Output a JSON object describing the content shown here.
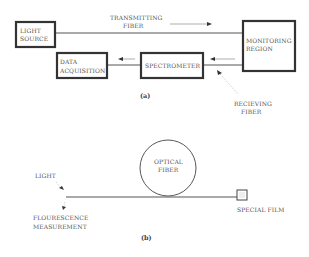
{
  "figure_a": {
    "caption": "(a)",
    "boxes": {
      "light_source": [
        "LIGHT",
        "SOURCE"
      ],
      "monitoring_region": [
        "MONITORING",
        "REGION"
      ],
      "spectrometer": [
        "SPECTROMETER"
      ],
      "data_acquisition": [
        "DATA",
        "ACQUISITION"
      ]
    },
    "labels": {
      "transmitting_fiber": [
        "TRANSMITTING",
        "FIBER"
      ],
      "receiving_fiber": [
        "RECIEVING",
        "FIBER"
      ]
    }
  },
  "figure_b": {
    "caption": "(b)",
    "labels": {
      "light": "LIGHT",
      "fluorescence": [
        "FLOURESCENCE",
        "MEASUREMENT"
      ],
      "optical_fiber": [
        "OPTICAL",
        "FIBER"
      ],
      "special_film": "SPECIAL FILM"
    }
  },
  "colors": {
    "box_stroke": "#333333",
    "line": "#555555",
    "text": "#555555"
  }
}
